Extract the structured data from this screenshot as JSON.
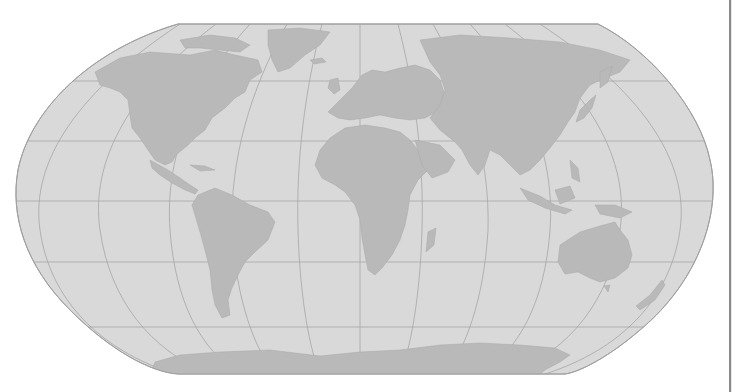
{
  "map": {
    "projection": "Robinson",
    "style": "grayscale world outline map",
    "colors": {
      "background": "#ffffff",
      "ocean": "#d9d9d9",
      "land": "#b9b9b9",
      "graticule": "#a6a6a6",
      "outline": "#a0a0a0",
      "right_edge": "#8a8a8a"
    },
    "graticule": {
      "meridian_step_deg": 30,
      "parallel_step_deg": 30
    },
    "continents": [
      "North America",
      "Greenland",
      "South America",
      "Europe",
      "Africa",
      "Madagascar",
      "Asia",
      "Japan",
      "Indonesia",
      "New Guinea",
      "Australia",
      "New Zealand",
      "Antarctica"
    ],
    "labels": []
  }
}
